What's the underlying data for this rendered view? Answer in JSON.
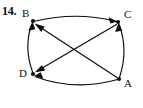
{
  "figure": {
    "problem_number": "14.",
    "ink_color": "#0a0a0a",
    "background_color": "#ffffff"
  },
  "vertices": [
    {
      "id": "B",
      "label": "B",
      "x": 33,
      "y": 21,
      "label_x": 22,
      "label_y": 10,
      "indegree": 2,
      "outdegree": 1
    },
    {
      "id": "C",
      "label": "C",
      "x": 118,
      "y": 22,
      "label_x": 124,
      "label_y": 11,
      "indegree": 3,
      "outdegree": 1
    },
    {
      "id": "D",
      "label": "D",
      "x": 33,
      "y": 74,
      "label_x": 20,
      "label_y": 70,
      "indegree": 2,
      "outdegree": 1
    },
    {
      "id": "A",
      "label": "A",
      "x": 119,
      "y": 79,
      "label_x": 124,
      "label_y": 79,
      "indegree": 0,
      "outdegree": 3
    }
  ],
  "edges": [
    {
      "id": "edge-b-c",
      "from": "B",
      "to": "C",
      "shape": "curve",
      "bow": "up",
      "arrow_at": "C"
    },
    {
      "id": "edge-d-b",
      "from": "D",
      "to": "B",
      "shape": "curve",
      "bow": "left",
      "arrow_at": "B"
    },
    {
      "id": "edge-a-c",
      "from": "A",
      "to": "C",
      "shape": "curve",
      "bow": "right",
      "arrow_at": "C"
    },
    {
      "id": "edge-a-d",
      "from": "A",
      "to": "D",
      "shape": "curve",
      "bow": "down",
      "arrow_at": "D"
    },
    {
      "id": "edge-a-b",
      "from": "A",
      "to": "B",
      "shape": "straight",
      "bow": "none",
      "arrow_at": "B"
    },
    {
      "id": "edge-c-d",
      "from": "C",
      "to": "D",
      "shape": "straight",
      "bow": "none",
      "arrow_at": "D"
    }
  ]
}
